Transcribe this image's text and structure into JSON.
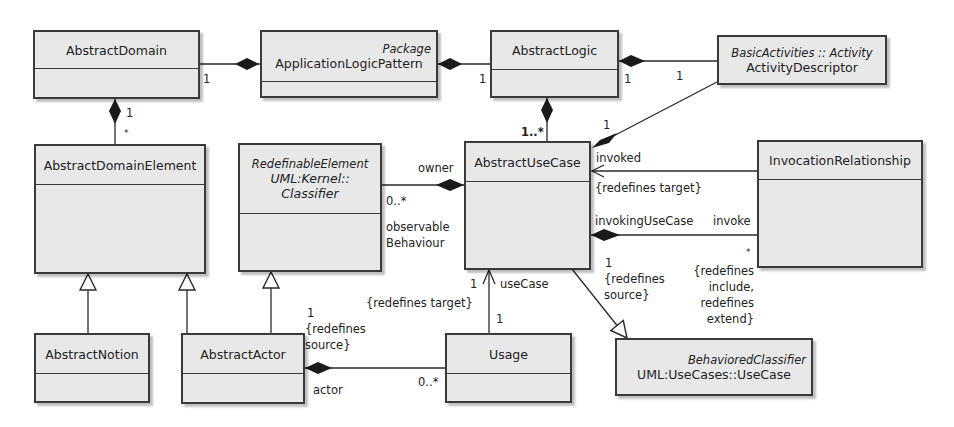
{
  "diagram": {
    "type": "UML class diagram",
    "classes": {
      "abstract_domain": {
        "name": "AbstractDomain"
      },
      "application_logic_pattern": {
        "stereotype": "Package",
        "name": "ApplicationLogicPattern"
      },
      "abstract_logic": {
        "name": "AbstractLogic"
      },
      "activity_descriptor": {
        "stereotype": "BasicActivities :: Activity",
        "name": "ActivityDescriptor"
      },
      "abstract_domain_element": {
        "name": "AbstractDomainElement"
      },
      "classifier": {
        "stereotype": "RedefinableElement",
        "name_line1": "UML:Kernel::",
        "name_line2": "Classifier"
      },
      "abstract_use_case": {
        "name": "AbstractUseCase"
      },
      "invocation_relationship": {
        "name": "InvocationRelationship"
      },
      "abstract_notion": {
        "name": "AbstractNotion"
      },
      "abstract_actor": {
        "name": "AbstractActor"
      },
      "usage": {
        "name": "Usage"
      },
      "behaviored_classifier": {
        "stereotype": "BehavioredClassifier",
        "name": "UML:UseCases::UseCase"
      }
    },
    "labels": {
      "ad_alp_mult": "1",
      "ad_ade_mult_1": "1",
      "ad_ade_mult_star": "*",
      "alp_al_mult": "1",
      "al_act_mult_1": "1",
      "al_act_mult_2": "1",
      "al_auc_mult": "1..*",
      "act_auc_mult": "1",
      "owner": "owner",
      "obs_mult": "0..*",
      "obs_role_1": "observable",
      "obs_role_2": "Behaviour",
      "invoked": "invoked",
      "redefines_target_1": "{redefines target}",
      "invoking_use_case": "invokingUseCase",
      "invoke": "invoke",
      "invoke_mult": "*",
      "redef_src_mult": "1",
      "redef_src_1": "{redefines",
      "redef_src_2": "source}",
      "redef_incl_1": "{redefines",
      "redef_incl_2": "include,",
      "redef_incl_3": "redefines",
      "redef_incl_4": "extend}",
      "usecase_mult": "1",
      "usecase_role": "useCase",
      "redefines_target_2": "{redefines target}",
      "usage_mult": "1",
      "actor_mult": "1",
      "actor_redef_1": "{redefines",
      "actor_redef_2": "source}",
      "actor_role": "actor",
      "usage_actor_mult": "0..*"
    },
    "colors": {
      "box_fill": "#e8e8e8",
      "line": "#2a2a2a",
      "background": "#ffffff"
    }
  }
}
